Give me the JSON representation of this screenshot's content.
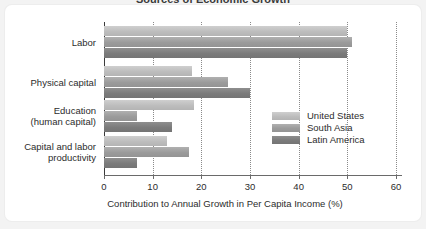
{
  "figure": {
    "clipped_title": "Sources of Economic Growth",
    "background_color": "#f3f3f3",
    "card_color": "#ffffff"
  },
  "chart_data": {
    "type": "bar",
    "orientation": "horizontal",
    "title": "",
    "xlabel": "Contribution to Annual Growth in Per Capita Income (%)",
    "ylabel": "",
    "xlim": [
      0,
      60
    ],
    "xticks": [
      0,
      10,
      20,
      30,
      40,
      50,
      60
    ],
    "xtick_labels": [
      "0",
      "10",
      "20",
      "30",
      "40",
      "50",
      "60"
    ],
    "grid": "vertical-dotted",
    "legend_position": "inside-right",
    "categories": [
      "Labor",
      "Physical capital",
      "Education\n(human capital)",
      "Capital and labor\nproductivity"
    ],
    "category_lines": [
      [
        "Labor"
      ],
      [
        "Physical capital"
      ],
      [
        "Education",
        "(human capital)"
      ],
      [
        "Capital and labor",
        "productivity"
      ]
    ],
    "series": [
      {
        "name": "United States",
        "color": "#c4c4c4",
        "values": [
          50,
          18,
          18.5,
          13
        ]
      },
      {
        "name": "South Asia",
        "color": "#9e9e9e",
        "values": [
          51,
          25.5,
          6.7,
          17.5
        ]
      },
      {
        "name": "Latin America",
        "color": "#7e7e7e",
        "values": [
          50,
          30,
          14,
          6.7
        ]
      }
    ]
  }
}
